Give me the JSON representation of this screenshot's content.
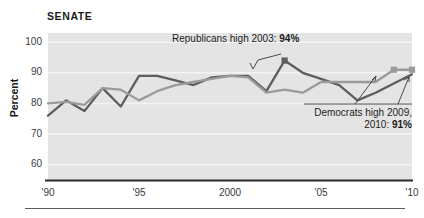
{
  "chart_data": {
    "type": "line",
    "title": "SENATE",
    "xlabel": "",
    "ylabel": "Percent",
    "ylim": [
      55,
      103
    ],
    "xlim": [
      1990,
      2010
    ],
    "grid": true,
    "grid_orientation": "horizontal",
    "legend": "none",
    "y_ticks": [
      60,
      70,
      80,
      90,
      100
    ],
    "x_ticks": [
      1990,
      1995,
      2000,
      2005,
      2010
    ],
    "x_tick_labels": [
      "'90",
      "'95",
      "2000",
      "'05",
      "'10"
    ],
    "x": [
      1990,
      1991,
      1992,
      1993,
      1994,
      1995,
      1996,
      1997,
      1998,
      1999,
      2000,
      2001,
      2002,
      2003,
      2004,
      2005,
      2006,
      2007,
      2008,
      2009,
      2010
    ],
    "series": [
      {
        "name": "Republicans",
        "color": "#5d5d5d",
        "values": [
          76,
          81,
          77.5,
          85,
          79,
          89,
          89,
          87.5,
          86,
          88.5,
          89,
          89,
          84,
          94,
          90,
          88,
          86,
          81,
          83.5,
          86.5,
          89.5
        ],
        "markers": [
          {
            "x": 2003,
            "y": 94,
            "label": "94%"
          }
        ]
      },
      {
        "name": "Democrats",
        "color": "#9a9a9a",
        "values": [
          80,
          80.5,
          79.5,
          85,
          84.5,
          81,
          84,
          86,
          87,
          88,
          89,
          88.5,
          83.5,
          84.5,
          83.5,
          87,
          87,
          87,
          87,
          91,
          91
        ],
        "markers": [
          {
            "x": 2009,
            "y": 91,
            "label": "91%"
          },
          {
            "x": 2010,
            "y": 91,
            "label": "91%"
          }
        ]
      }
    ],
    "annotations": [
      {
        "id": "republicans-peak",
        "text_plain": "Republicans high 2003: 94%",
        "text_lead": "Republicans high 2003: ",
        "text_bold": "94%",
        "points_to": {
          "x": 2003,
          "y": 94
        }
      },
      {
        "id": "democrats-peak",
        "text_plain": "Democrats high 2009, 2010: 91%",
        "line1": "Democrats high 2009,",
        "line2_lead": "2010: ",
        "line2_bold": "91%",
        "points_to": [
          {
            "x": 2009,
            "y": 91
          },
          {
            "x": 2010,
            "y": 91
          }
        ]
      }
    ],
    "colors": {
      "plot_background": "#e4e4e4",
      "gridline": "#f4f4f4",
      "axis": "#2b2b2b",
      "republicans": "#5d5d5d",
      "democrats": "#9a9a9a",
      "text": "#1c1c1c",
      "footer_rule": "#5b5b5b"
    }
  },
  "footer": {
    "rule": true
  }
}
